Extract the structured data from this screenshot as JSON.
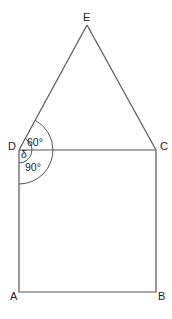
{
  "diagram": {
    "type": "geometry",
    "points": {
      "A": {
        "label": "A",
        "x": 19,
        "y": 292
      },
      "B": {
        "label": "B",
        "x": 156,
        "y": 292
      },
      "C": {
        "label": "C",
        "x": 156,
        "y": 150
      },
      "D": {
        "label": "D",
        "x": 19,
        "y": 150
      },
      "E": {
        "label": "E",
        "x": 87,
        "y": 25
      }
    },
    "angles": {
      "triangle_angle": "60°",
      "square_angle": "90°",
      "delta": "δ"
    },
    "colors": {
      "line": "#555555",
      "text": "#222222",
      "background": "#ffffff"
    }
  }
}
